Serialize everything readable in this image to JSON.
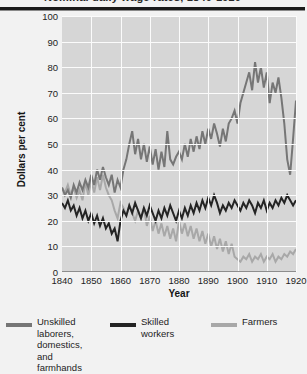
{
  "title": "Nominal daily wage rates, 1840-1920",
  "axes": {
    "y_title": "Dollars per cent",
    "x_title": "Year",
    "y_ticks": [
      100,
      90,
      80,
      70,
      60,
      50,
      40,
      30,
      20,
      10,
      0
    ],
    "x_ticks": [
      1840,
      1850,
      1860,
      1870,
      1880,
      1890,
      1900,
      1910,
      1920
    ]
  },
  "legend": {
    "items": [
      {
        "label": "Unskilled\nlaborers,\ndomestics,\nand farmhands",
        "color": "#767676"
      },
      {
        "label": "Skilled workers",
        "color": "#242424"
      },
      {
        "label": "Farmers",
        "color": "#a8a8a8"
      }
    ]
  },
  "chart_data": {
    "type": "line",
    "title": "Nominal daily wage rates, 1840-1920",
    "xlabel": "Year",
    "ylabel": "Dollars per cent",
    "xlim": [
      1840,
      1920
    ],
    "ylim": [
      0,
      100
    ],
    "grid": true,
    "legend_position": "below",
    "x": [
      1840,
      1841,
      1842,
      1843,
      1844,
      1845,
      1846,
      1847,
      1848,
      1849,
      1850,
      1851,
      1852,
      1853,
      1854,
      1855,
      1856,
      1857,
      1858,
      1859,
      1860,
      1861,
      1862,
      1863,
      1864,
      1865,
      1866,
      1867,
      1868,
      1869,
      1870,
      1871,
      1872,
      1873,
      1874,
      1875,
      1876,
      1877,
      1878,
      1879,
      1880,
      1881,
      1882,
      1883,
      1884,
      1885,
      1886,
      1887,
      1888,
      1889,
      1890,
      1891,
      1892,
      1893,
      1894,
      1895,
      1896,
      1897,
      1898,
      1899,
      1900,
      1901,
      1902,
      1903,
      1904,
      1905,
      1906,
      1907,
      1908,
      1909,
      1910,
      1911,
      1912,
      1913,
      1914,
      1915,
      1916,
      1917,
      1918,
      1919,
      1920
    ],
    "series": [
      {
        "name": "Unskilled laborers, domestics, and farmhands",
        "color": "#767676",
        "values": [
          33,
          30,
          32,
          29,
          34,
          31,
          35,
          32,
          36,
          33,
          38,
          34,
          40,
          36,
          41,
          37,
          34,
          38,
          31,
          36,
          33,
          40,
          44,
          50,
          55,
          46,
          52,
          44,
          50,
          43,
          49,
          42,
          48,
          40,
          47,
          41,
          55,
          44,
          42,
          45,
          47,
          44,
          50,
          45,
          52,
          47,
          53,
          48,
          55,
          50,
          56,
          52,
          58,
          54,
          49,
          56,
          51,
          58,
          60,
          63,
          58,
          66,
          70,
          74,
          78,
          71,
          82,
          74,
          80,
          72,
          78,
          66,
          74,
          70,
          76,
          68,
          58,
          44,
          38,
          52,
          67
        ]
      },
      {
        "name": "Skilled workers",
        "color": "#242424",
        "values": [
          27,
          25,
          28,
          24,
          26,
          22,
          25,
          21,
          24,
          20,
          23,
          19,
          22,
          18,
          21,
          17,
          19,
          15,
          17,
          12,
          20,
          24,
          22,
          26,
          23,
          27,
          24,
          21,
          25,
          22,
          26,
          23,
          20,
          24,
          21,
          25,
          22,
          26,
          23,
          20,
          24,
          21,
          25,
          22,
          26,
          23,
          27,
          24,
          28,
          25,
          29,
          26,
          30,
          27,
          23,
          26,
          24,
          27,
          25,
          28,
          26,
          24,
          27,
          25,
          28,
          26,
          23,
          27,
          25,
          28,
          24,
          27,
          25,
          28,
          26,
          29,
          27,
          30,
          28,
          26,
          28
        ]
      },
      {
        "name": "Farmers",
        "color": "#a8a8a8",
        "values": [
          33,
          31,
          34,
          30,
          33,
          29,
          32,
          28,
          35,
          30,
          36,
          31,
          37,
          32,
          38,
          33,
          30,
          28,
          24,
          21,
          27,
          25,
          22,
          26,
          23,
          20,
          24,
          21,
          25,
          18,
          22,
          16,
          20,
          15,
          19,
          14,
          18,
          13,
          17,
          12,
          20,
          15,
          19,
          14,
          18,
          13,
          17,
          12,
          16,
          11,
          15,
          10,
          14,
          9,
          13,
          8,
          12,
          7,
          11,
          6,
          5,
          4,
          6,
          5,
          7,
          4,
          6,
          5,
          7,
          4,
          6,
          5,
          7,
          4,
          6,
          5,
          7,
          6,
          8,
          7,
          9
        ]
      }
    ]
  }
}
